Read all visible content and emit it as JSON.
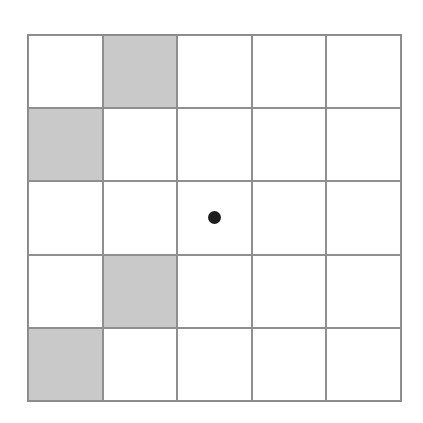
{
  "grid": {
    "rows": 5,
    "cols": 5,
    "colors": {
      "shaded": "#c9c9c9",
      "empty": "#ffffff",
      "line": "#8f8f8f",
      "dot": "#1e1e1e"
    },
    "shaded_cells": [
      [
        0,
        1
      ],
      [
        1,
        0
      ],
      [
        3,
        1
      ],
      [
        4,
        0
      ]
    ],
    "dot_cells": [
      [
        2,
        2
      ]
    ]
  }
}
